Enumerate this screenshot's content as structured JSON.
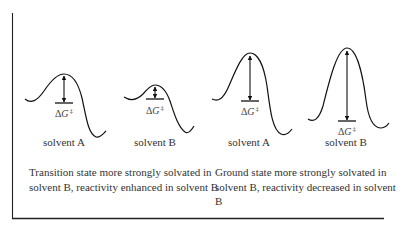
{
  "figure": {
    "frame": {
      "stroke": "#222222"
    },
    "panels": [
      {
        "id": "ts-solvated",
        "diagrams": [
          {
            "solvent_label": "solvent A",
            "barrier_label": {
              "delta": "Δ",
              "var": "G",
              "sup": "‡"
            },
            "relative_barrier": "large"
          },
          {
            "solvent_label": "solvent B",
            "barrier_label": {
              "delta": "Δ",
              "var": "G",
              "sup": "‡"
            },
            "relative_barrier": "small"
          }
        ],
        "caption": "Transition state more strongly solvated in solvent B, reactivity enhanced in solvent B"
      },
      {
        "id": "gs-solvated",
        "diagrams": [
          {
            "solvent_label": "solvent A",
            "barrier_label": {
              "delta": "Δ",
              "var": "G",
              "sup": "‡"
            },
            "relative_barrier": "medium"
          },
          {
            "solvent_label": "solvent B",
            "barrier_label": {
              "delta": "Δ",
              "var": "G",
              "sup": "‡"
            },
            "relative_barrier": "large"
          }
        ],
        "caption": "Ground state more strongly solvated in solvent B, reactivity decreased in solvent B"
      }
    ]
  }
}
